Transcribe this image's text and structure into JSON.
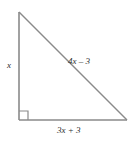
{
  "figure": {
    "name": "right-triangle-diagram",
    "background_color": "#ffffff",
    "stroke_color": "#888888",
    "text_color": "#2b2b2b",
    "labels": {
      "vertical_leg": "x",
      "hypotenuse": "4x – 3",
      "horizontal_leg": "3x + 3"
    },
    "geometry": {
      "apex": [
        19,
        12
      ],
      "right_angle_vertex": [
        19,
        120
      ],
      "right_vertex": [
        127,
        120
      ],
      "right_angle_marker_size": 9
    }
  }
}
